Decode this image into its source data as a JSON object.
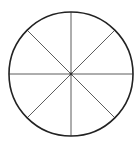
{
  "diagram": {
    "type": "circle-divided-into-equal-sectors",
    "sectors": 8,
    "center": {
      "x": 71,
      "y": 74
    },
    "radius": 62,
    "outline_color": "#222222",
    "outline_width": 1.6,
    "spoke_color": "#4a4a4a",
    "spoke_width": 0.9,
    "fill_color": "#ffffff",
    "spoke_angles_deg": [
      0,
      45,
      90,
      135
    ]
  }
}
